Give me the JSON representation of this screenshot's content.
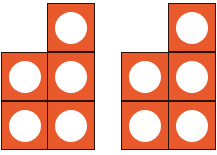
{
  "colors": {
    "tile": "#e85a2c",
    "border": "#2a1208",
    "counter": "#ffffff"
  },
  "figures": [
    {
      "name": "figure-left",
      "cells": [
        [
          47,
          3
        ],
        [
          1,
          52
        ],
        [
          47,
          52
        ],
        [
          1,
          101
        ],
        [
          47,
          101
        ]
      ]
    },
    {
      "name": "figure-right",
      "cells": [
        [
          168,
          3
        ],
        [
          121,
          52
        ],
        [
          168,
          52
        ],
        [
          121,
          101
        ],
        [
          168,
          101
        ]
      ]
    }
  ]
}
